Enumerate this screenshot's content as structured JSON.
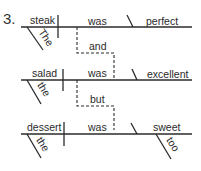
{
  "diagram": {
    "number": "3.",
    "clauses": [
      {
        "subject": "steak",
        "subject_modifier": "The",
        "verb": "was",
        "complement": "perfect",
        "complement_modifier": null
      },
      {
        "subject": "salad",
        "subject_modifier": "the",
        "verb": "was",
        "complement": "excellent",
        "complement_modifier": null
      },
      {
        "subject": "dessert",
        "subject_modifier": "the",
        "verb": "was",
        "complement": "sweet",
        "complement_modifier": "too"
      }
    ],
    "conjunctions": [
      "and",
      "but"
    ]
  }
}
